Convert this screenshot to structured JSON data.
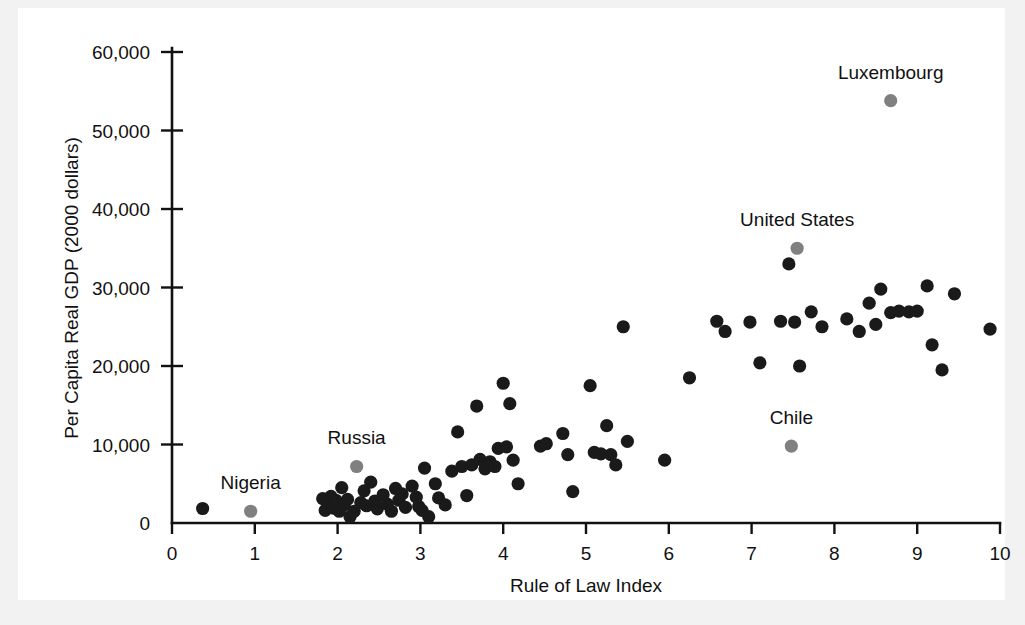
{
  "figure": {
    "background_color": "#f2f2f2",
    "panel_color": "#ffffff",
    "point_color": "#1a1a1a",
    "highlight_color": "#808080"
  },
  "chart_data": {
    "type": "scatter",
    "title": "",
    "xlabel": "Rule of Law Index",
    "ylabel": "Per Capita Real GDP (2000 dollars)",
    "xlim": [
      0,
      10
    ],
    "ylim": [
      0,
      60000
    ],
    "xticks": [
      0,
      1,
      2,
      3,
      4,
      5,
      6,
      7,
      8,
      9,
      10
    ],
    "xtick_labels": [
      "0",
      "1",
      "2",
      "3",
      "4",
      "5",
      "6",
      "7",
      "8",
      "9",
      "10"
    ],
    "yticks": [
      0,
      10000,
      20000,
      30000,
      40000,
      50000,
      60000
    ],
    "ytick_labels": [
      "0",
      "10,000",
      "20,000",
      "30,000",
      "40,000",
      "50,000",
      "60,000"
    ],
    "grid": false,
    "legend": "none",
    "annotations": [
      {
        "label": "Nigeria",
        "x": 0.95,
        "y": 1500,
        "label_dx": 0,
        "label_dy": -22
      },
      {
        "label": "Russia",
        "x": 2.23,
        "y": 7200,
        "label_dx": 0,
        "label_dy": -22
      },
      {
        "label": "Chile",
        "x": 7.48,
        "y": 9800,
        "label_dx": 0,
        "label_dy": -22
      },
      {
        "label": "United States",
        "x": 7.55,
        "y": 35000,
        "label_dx": 0,
        "label_dy": -22
      },
      {
        "label": "Luxembourg",
        "x": 8.68,
        "y": 53800,
        "label_dx": 0,
        "label_dy": -22
      }
    ],
    "highlighted_points": [
      {
        "name": "Nigeria",
        "x": 0.95,
        "y": 1500
      },
      {
        "name": "Russia",
        "x": 2.23,
        "y": 7200
      },
      {
        "name": "Chile",
        "x": 7.48,
        "y": 9800
      },
      {
        "name": "United States",
        "x": 7.55,
        "y": 35000
      },
      {
        "name": "Luxembourg",
        "x": 8.68,
        "y": 53800
      }
    ],
    "points": [
      {
        "x": 0.37,
        "y": 1850
      },
      {
        "x": 1.82,
        "y": 3100
      },
      {
        "x": 1.85,
        "y": 1600
      },
      {
        "x": 1.88,
        "y": 2600
      },
      {
        "x": 1.92,
        "y": 3400
      },
      {
        "x": 1.95,
        "y": 1900
      },
      {
        "x": 1.98,
        "y": 2900
      },
      {
        "x": 2.02,
        "y": 1500
      },
      {
        "x": 2.05,
        "y": 4500
      },
      {
        "x": 2.08,
        "y": 2300
      },
      {
        "x": 2.12,
        "y": 3000
      },
      {
        "x": 2.15,
        "y": 800
      },
      {
        "x": 2.2,
        "y": 1500
      },
      {
        "x": 2.28,
        "y": 2600
      },
      {
        "x": 2.32,
        "y": 4100
      },
      {
        "x": 2.35,
        "y": 2200
      },
      {
        "x": 2.4,
        "y": 5200
      },
      {
        "x": 2.45,
        "y": 2800
      },
      {
        "x": 2.48,
        "y": 1800
      },
      {
        "x": 2.55,
        "y": 3600
      },
      {
        "x": 2.6,
        "y": 2400
      },
      {
        "x": 2.65,
        "y": 1500
      },
      {
        "x": 2.7,
        "y": 4400
      },
      {
        "x": 2.74,
        "y": 2900
      },
      {
        "x": 2.78,
        "y": 3700
      },
      {
        "x": 2.82,
        "y": 2000
      },
      {
        "x": 2.9,
        "y": 4700
      },
      {
        "x": 2.95,
        "y": 3300
      },
      {
        "x": 2.98,
        "y": 2100
      },
      {
        "x": 3.02,
        "y": 1600
      },
      {
        "x": 3.05,
        "y": 7000
      },
      {
        "x": 3.1,
        "y": 800
      },
      {
        "x": 3.18,
        "y": 5000
      },
      {
        "x": 3.22,
        "y": 3200
      },
      {
        "x": 3.3,
        "y": 2300
      },
      {
        "x": 3.38,
        "y": 6600
      },
      {
        "x": 3.45,
        "y": 11600
      },
      {
        "x": 3.5,
        "y": 7200
      },
      {
        "x": 3.56,
        "y": 3500
      },
      {
        "x": 3.62,
        "y": 7400
      },
      {
        "x": 3.68,
        "y": 14900
      },
      {
        "x": 3.72,
        "y": 8100
      },
      {
        "x": 3.78,
        "y": 6900
      },
      {
        "x": 3.84,
        "y": 7800
      },
      {
        "x": 3.9,
        "y": 7200
      },
      {
        "x": 3.94,
        "y": 9500
      },
      {
        "x": 4.0,
        "y": 17800
      },
      {
        "x": 4.04,
        "y": 9700
      },
      {
        "x": 4.08,
        "y": 15200
      },
      {
        "x": 4.12,
        "y": 8000
      },
      {
        "x": 4.18,
        "y": 5000
      },
      {
        "x": 4.45,
        "y": 9800
      },
      {
        "x": 4.52,
        "y": 10100
      },
      {
        "x": 4.72,
        "y": 11400
      },
      {
        "x": 4.78,
        "y": 8700
      },
      {
        "x": 4.84,
        "y": 4000
      },
      {
        "x": 5.05,
        "y": 17500
      },
      {
        "x": 5.1,
        "y": 9000
      },
      {
        "x": 5.18,
        "y": 8800
      },
      {
        "x": 5.25,
        "y": 12400
      },
      {
        "x": 5.3,
        "y": 8700
      },
      {
        "x": 5.36,
        "y": 7400
      },
      {
        "x": 5.45,
        "y": 25000
      },
      {
        "x": 5.5,
        "y": 10400
      },
      {
        "x": 5.95,
        "y": 8000
      },
      {
        "x": 6.25,
        "y": 18500
      },
      {
        "x": 6.58,
        "y": 25700
      },
      {
        "x": 6.68,
        "y": 24400
      },
      {
        "x": 6.98,
        "y": 25600
      },
      {
        "x": 7.1,
        "y": 20400
      },
      {
        "x": 7.35,
        "y": 25700
      },
      {
        "x": 7.45,
        "y": 33000
      },
      {
        "x": 7.52,
        "y": 25600
      },
      {
        "x": 7.58,
        "y": 20000
      },
      {
        "x": 7.72,
        "y": 26900
      },
      {
        "x": 7.85,
        "y": 25000
      },
      {
        "x": 8.15,
        "y": 26000
      },
      {
        "x": 8.3,
        "y": 24400
      },
      {
        "x": 8.42,
        "y": 28000
      },
      {
        "x": 8.5,
        "y": 25300
      },
      {
        "x": 8.56,
        "y": 29800
      },
      {
        "x": 8.68,
        "y": 26800
      },
      {
        "x": 8.78,
        "y": 27000
      },
      {
        "x": 8.9,
        "y": 26900
      },
      {
        "x": 9.0,
        "y": 27000
      },
      {
        "x": 9.12,
        "y": 30200
      },
      {
        "x": 9.18,
        "y": 22700
      },
      {
        "x": 9.3,
        "y": 19500
      },
      {
        "x": 9.45,
        "y": 29200
      },
      {
        "x": 9.88,
        "y": 24700
      }
    ]
  }
}
